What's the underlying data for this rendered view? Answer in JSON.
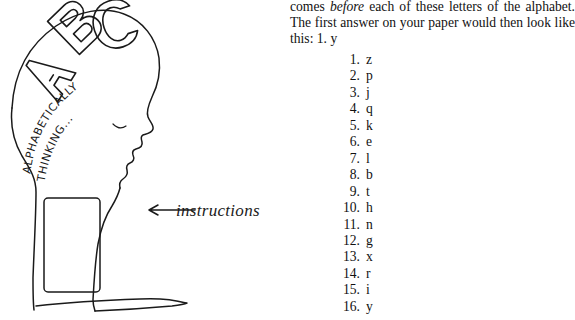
{
  "page": {
    "background_color": "#ffffff",
    "ink_color": "#1a1a1a",
    "width": 575,
    "height": 320
  },
  "illustration": {
    "name": "alphabetically-thinking-head-sketch",
    "brain_letters": [
      "A",
      "B",
      "C"
    ],
    "arc_text_outer": "ALPHABETICALLY",
    "arc_text_inner": "THINKING...",
    "annotation": "instructions",
    "annotation_arrow": "←"
  },
  "body_text": {
    "before_word": "before",
    "part1": "comes ",
    "part2": " each of these letters of the alphabet. The first answer on your paper would then look like this: 1. y"
  },
  "answers": {
    "items": [
      {
        "num": "1.",
        "val": "z"
      },
      {
        "num": "2.",
        "val": "p"
      },
      {
        "num": "3.",
        "val": "j"
      },
      {
        "num": "4.",
        "val": "q"
      },
      {
        "num": "5.",
        "val": "k"
      },
      {
        "num": "6.",
        "val": "e"
      },
      {
        "num": "7.",
        "val": "l"
      },
      {
        "num": "8.",
        "val": "b"
      },
      {
        "num": "9.",
        "val": "t"
      },
      {
        "num": "10.",
        "val": "h"
      },
      {
        "num": "11.",
        "val": "n"
      },
      {
        "num": "12.",
        "val": "g"
      },
      {
        "num": "13.",
        "val": "x"
      },
      {
        "num": "14.",
        "val": "r"
      },
      {
        "num": "15.",
        "val": "i"
      },
      {
        "num": "16.",
        "val": "y"
      }
    ]
  }
}
